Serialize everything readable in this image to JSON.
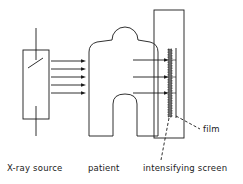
{
  "diagram": {
    "labels": {
      "source": "X-ray source",
      "patient": "patient",
      "screen": "intensifying screen",
      "film": "film"
    },
    "incident_arrow_count": 5,
    "transmitted_arrow_count": 3,
    "colors": {
      "line": "#1a1a1a",
      "background": "#ffffff",
      "screen_fill": "#6a6a6a"
    }
  }
}
